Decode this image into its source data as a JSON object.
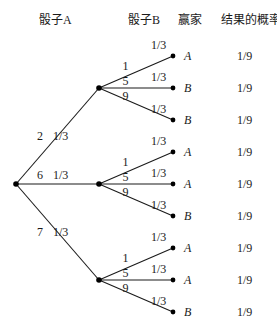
{
  "headers": {
    "die_a": "骰子A",
    "die_b": "骰子B",
    "winner": "赢家",
    "probability": "结果的概率"
  },
  "tree": {
    "root": {
      "x": 16,
      "y": 184
    },
    "branches": [
      {
        "die_a_value": "2",
        "prob": "1/3",
        "node": {
          "x": 99,
          "y": 88
        },
        "outcomes": [
          {
            "die_b_value": "1",
            "prob": "1/3",
            "winner": "A",
            "result_prob": "1/9",
            "y": 56
          },
          {
            "die_b_value": "5",
            "prob": "1/3",
            "winner": "B",
            "result_prob": "1/9",
            "y": 88
          },
          {
            "die_b_value": "9",
            "prob": "1/3",
            "winner": "B",
            "result_prob": "1/9",
            "y": 120
          }
        ]
      },
      {
        "die_a_value": "6",
        "prob": "1/3",
        "node": {
          "x": 99,
          "y": 184
        },
        "outcomes": [
          {
            "die_b_value": "1",
            "prob": "1/3",
            "winner": "A",
            "result_prob": "1/9",
            "y": 152
          },
          {
            "die_b_value": "5",
            "prob": "1/3",
            "winner": "A",
            "result_prob": "1/9",
            "y": 184
          },
          {
            "die_b_value": "9",
            "prob": "1/3",
            "winner": "B",
            "result_prob": "1/9",
            "y": 216
          }
        ]
      },
      {
        "die_a_value": "7",
        "prob": "1/3",
        "node": {
          "x": 99,
          "y": 280
        },
        "outcomes": [
          {
            "die_b_value": "1",
            "prob": "1/3",
            "winner": "A",
            "result_prob": "1/9",
            "y": 248
          },
          {
            "die_b_value": "5",
            "prob": "1/3",
            "winner": "A",
            "result_prob": "1/9",
            "y": 280
          },
          {
            "die_b_value": "9",
            "prob": "1/3",
            "winner": "B",
            "result_prob": "1/9",
            "y": 312
          }
        ]
      }
    ]
  }
}
